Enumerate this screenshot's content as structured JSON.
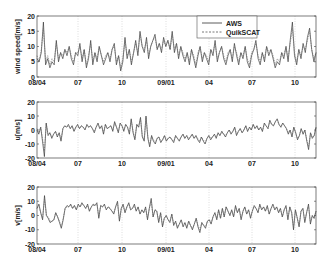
{
  "chart_data": {
    "type": "line",
    "x_ticks": [
      "08/04",
      "07",
      "10",
      "09/01",
      "04",
      "07",
      "10"
    ],
    "x_tick_pos": [
      37,
      78,
      122,
      166,
      209,
      252,
      295
    ],
    "legend": [
      {
        "name": "AWS",
        "style": "solid"
      },
      {
        "name": "QuikSCAT",
        "style": "dashed"
      }
    ],
    "legend_position": "upper right (first panel)",
    "grid": "vertical dotted at x ticks",
    "panels": [
      {
        "ylabel": "wind speed[m/s]",
        "ylim": [
          0,
          20
        ],
        "yticks": [
          "0",
          "5",
          "10",
          "15",
          "20"
        ],
        "series": [
          {
            "name": "AWS",
            "values": [
              6,
              5,
              8,
              18,
              4,
              6,
              3,
              5,
              4,
              12,
              5,
              8,
              6,
              9,
              7,
              10,
              6,
              4,
              8,
              7,
              11,
              5,
              9,
              3,
              6,
              12,
              4,
              8,
              5,
              10,
              7,
              4,
              6,
              8,
              5,
              9,
              11,
              4,
              7,
              2,
              5,
              13,
              6,
              9,
              4,
              8,
              12,
              7,
              15,
              10,
              8,
              13,
              6,
              10,
              12,
              14,
              9,
              11,
              8,
              13,
              10,
              12,
              9,
              15,
              8,
              11,
              6,
              10,
              7,
              5,
              8,
              4,
              9,
              6,
              3,
              7,
              10,
              5,
              8,
              6,
              4,
              9,
              7,
              12,
              5,
              8,
              10,
              6,
              4,
              7,
              9,
              5,
              11,
              7,
              4,
              8,
              6,
              10,
              5,
              3,
              7,
              9,
              12,
              6,
              4,
              8,
              5,
              10,
              7,
              9,
              6,
              3,
              5,
              4,
              8,
              6,
              10,
              5,
              12,
              18,
              7,
              4,
              9,
              6,
              11,
              8,
              13,
              16,
              9,
              5,
              8
            ]
          },
          {
            "name": "QuikSCAT",
            "values": [
              7,
              5,
              9,
              16,
              5,
              7,
              4,
              6,
              5,
              11,
              6,
              8,
              7,
              9,
              8,
              10,
              7,
              5,
              8,
              8,
              10,
              6,
              9,
              4,
              7,
              11,
              5,
              8,
              6,
              10,
              7,
              5,
              7,
              8,
              6,
              9,
              10,
              5,
              7,
              3,
              6,
              12,
              7,
              9,
              5,
              8,
              11,
              8,
              14,
              10,
              9,
              12,
              7,
              10,
              12,
              13,
              9,
              11,
              9,
              12,
              10,
              12,
              9,
              14,
              9,
              11,
              7,
              10,
              8,
              6,
              8,
              5,
              9,
              7,
              4,
              8,
              10,
              6,
              8,
              7,
              5,
              9,
              8,
              11,
              6,
              8,
              10,
              7,
              5,
              8,
              9,
              6,
              10,
              8,
              5,
              8,
              7,
              10,
              6,
              4,
              8,
              9,
              11,
              7,
              5,
              8,
              6,
              10,
              8,
              9,
              7,
              4,
              6,
              5,
              8,
              7,
              10,
              6,
              11,
              16,
              8,
              5,
              9,
              7,
              10,
              9,
              12,
              15,
              9,
              6,
              8
            ]
          }
        ]
      },
      {
        "ylabel": "u[m/s]",
        "ylim": [
          -20,
          20
        ],
        "yticks": [
          "-20",
          "-10",
          "0",
          "10",
          "20"
        ],
        "series": [
          {
            "name": "AWS",
            "values": [
              0,
              -3,
              2,
              -8,
              -19,
              5,
              -4,
              -2,
              -6,
              -3,
              -1,
              -5,
              -2,
              -8,
              1,
              3,
              2,
              4,
              1,
              3,
              -1,
              2,
              4,
              1,
              3,
              2,
              0,
              4,
              2,
              3,
              1,
              -2,
              2,
              5,
              1,
              3,
              -3,
              4,
              1,
              2,
              3,
              -1,
              6,
              2,
              -2,
              5,
              3,
              -1,
              4,
              2,
              -3,
              8,
              -2,
              -7,
              4,
              2,
              9,
              -5,
              -8,
              10,
              -6,
              -12,
              -4,
              -8,
              -10,
              -6,
              -5,
              -9,
              -7,
              -4,
              -8,
              -6,
              -5,
              -7,
              -9,
              -4,
              -6,
              -8,
              -5,
              -3,
              -6,
              -4,
              -7,
              -5,
              -3,
              -6,
              -4,
              -7,
              -9,
              -5,
              -8,
              -10,
              -6,
              -4,
              -7,
              -5,
              -3,
              -6,
              -2,
              -4,
              -1,
              -3,
              -5,
              -2,
              0,
              -3,
              -1,
              2,
              -4,
              -1,
              1,
              -2,
              0,
              3,
              -1,
              2,
              0,
              4,
              1,
              3,
              0,
              2,
              -1,
              5,
              3,
              1,
              7,
              4,
              3,
              6,
              8,
              4,
              2,
              5,
              3,
              1,
              -3,
              0,
              -5,
              2,
              -2,
              -7,
              -4,
              1,
              -3,
              0,
              -8,
              -14,
              -2,
              -6,
              -4,
              2
            ]
          },
          {
            "name": "QuikSCAT",
            "values": [
              1,
              -2,
              2,
              -6,
              -15,
              4,
              -3,
              -2,
              -5,
              -3,
              -1,
              -4,
              -2,
              -7,
              1,
              3,
              2,
              3,
              1,
              3,
              -1,
              2,
              3,
              1,
              3,
              2,
              1,
              3,
              2,
              3,
              1,
              -1,
              2,
              4,
              1,
              3,
              -2,
              4,
              1,
              2,
              3,
              0,
              5,
              2,
              -1,
              4,
              3,
              0,
              4,
              2,
              -2,
              7,
              -1,
              -6,
              4,
              2,
              8,
              -4,
              -7,
              9,
              -5,
              -11,
              -4,
              -7,
              -9,
              -6,
              -5,
              -8,
              -7,
              -4,
              -7,
              -6,
              -5,
              -7,
              -8,
              -4,
              -6,
              -7,
              -5,
              -3,
              -6,
              -4,
              -6,
              -5,
              -3,
              -6,
              -4,
              -6,
              -8,
              -5,
              -7,
              -9,
              -6,
              -4,
              -6,
              -5,
              -3,
              -5,
              -2,
              -4,
              -1,
              -3,
              -4,
              -2,
              0,
              -2,
              -1,
              2,
              -3,
              -1,
              1,
              -2,
              0,
              3,
              -1,
              2,
              0,
              4,
              1,
              3,
              0,
              2,
              -1,
              4,
              3,
              1,
              6,
              4,
              3,
              6,
              7,
              4,
              2,
              5,
              3,
              1,
              -2,
              0,
              -4,
              2,
              -2,
              -6,
              -4,
              1,
              -3,
              0,
              -7,
              -12,
              -2,
              -5,
              -4,
              2
            ]
          }
        ]
      },
      {
        "ylabel": "v[m/s]",
        "ylim": [
          -20,
          20
        ],
        "yticks": [
          "-20",
          "-10",
          "0",
          "10",
          "20"
        ],
        "series": [
          {
            "name": "AWS",
            "values": [
              5,
              8,
              2,
              -3,
              14,
              0,
              -2,
              -5,
              -4,
              -3,
              2,
              -1,
              -5,
              -9,
              -3,
              5,
              7,
              6,
              8,
              5,
              7,
              4,
              8,
              6,
              9,
              7,
              5,
              8,
              3,
              6,
              8,
              7,
              9,
              -2,
              7,
              6,
              8,
              4,
              6,
              5,
              3,
              1,
              6,
              10,
              -4,
              5,
              8,
              2,
              6,
              9,
              4,
              5,
              8,
              3,
              6,
              1,
              4,
              2,
              6,
              -3,
              5,
              12,
              -1,
              4,
              3,
              -5,
              2,
              -8,
              -2,
              0,
              -3,
              -5,
              1,
              -7,
              -4,
              -9,
              -6,
              -3,
              -8,
              -5,
              -9,
              -4,
              -7,
              -10,
              -6,
              -2,
              -8,
              -12,
              -5,
              -7,
              -9,
              -4,
              -3,
              -6,
              -1,
              2,
              -3,
              4,
              -2,
              5,
              -1,
              6,
              3,
              0,
              4,
              -1,
              7,
              2,
              5,
              -3,
              3,
              6,
              1,
              4,
              -2,
              3,
              7,
              5,
              2,
              8,
              4,
              6,
              3,
              7,
              1,
              5,
              8,
              4,
              6,
              2,
              5,
              -1,
              4,
              7,
              -3,
              6,
              2,
              -10,
              4,
              -2,
              -8,
              3,
              5,
              -5,
              2,
              8,
              -6,
              0,
              -2,
              3
            ]
          },
          {
            "name": "QuikSCAT",
            "values": [
              5,
              7,
              2,
              -2,
              12,
              0,
              -1,
              -4,
              -4,
              -3,
              2,
              -1,
              -4,
              -8,
              -2,
              5,
              6,
              6,
              7,
              5,
              7,
              4,
              7,
              6,
              8,
              7,
              5,
              7,
              3,
              6,
              7,
              7,
              8,
              -1,
              7,
              6,
              7,
              4,
              6,
              5,
              3,
              2,
              6,
              9,
              -3,
              5,
              7,
              2,
              6,
              8,
              4,
              5,
              7,
              3,
              6,
              1,
              4,
              2,
              5,
              -2,
              5,
              10,
              -1,
              4,
              3,
              -4,
              2,
              -7,
              -2,
              0,
              -3,
              -4,
              1,
              -6,
              -4,
              -8,
              -6,
              -3,
              -7,
              -5,
              -8,
              -4,
              -7,
              -9,
              -6,
              -2,
              -7,
              -10,
              -5,
              -7,
              -8,
              -4,
              -3,
              -5,
              -1,
              2,
              -2,
              4,
              -2,
              5,
              -1,
              6,
              3,
              0,
              4,
              -1,
              6,
              2,
              5,
              -2,
              3,
              6,
              1,
              4,
              -1,
              3,
              6,
              5,
              2,
              7,
              4,
              6,
              3,
              6,
              1,
              5,
              7,
              4,
              6,
              2,
              5,
              -1,
              4,
              6,
              -2,
              6,
              2,
              -8,
              4,
              -2,
              -7,
              3,
              5,
              -4,
              2,
              7,
              -5,
              0,
              -2,
              3
            ]
          }
        ]
      }
    ]
  }
}
